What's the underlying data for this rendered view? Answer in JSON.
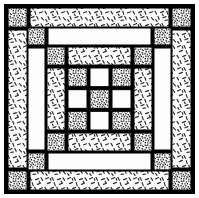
{
  "diagram": {
    "type": "quilt-block-diagram",
    "symmetry": "4-fold rotational",
    "canvas": {
      "width": 199,
      "height": 198
    },
    "background_color": "#ffffff",
    "line_color": "#000000",
    "outer_margin": 4,
    "sashing_width": 3
  },
  "fabrics": [
    {
      "key": "dark",
      "name": "dark-stipple-fabric",
      "description": "dense dark random stipple print",
      "base_color": "#f2f2f2",
      "mark_color": "#1a1a1a",
      "density": "dense"
    },
    {
      "key": "light",
      "name": "light-dash-fabric",
      "description": "sparse short dashes at varied angles",
      "base_color": "#fbfbfb",
      "mark_color": "#2b2b2b",
      "density": "sparse"
    },
    {
      "key": "plain",
      "name": "plain-white-fabric",
      "description": "solid unprinted white",
      "base_color": "#fdfdfd",
      "mark_color": "#fdfdfd",
      "density": "none"
    }
  ],
  "frame": {
    "name": "outer-frame-border",
    "x": 4,
    "y": 4,
    "width": 191,
    "height": 190
  },
  "rings": [
    {
      "name": "ring-outer",
      "index": 1,
      "corner_fabric": "dark",
      "band_fabric": "light",
      "bounds": {
        "x": 5,
        "y": 5,
        "width": 189,
        "height": 188
      },
      "corner_size": 19
    },
    {
      "name": "ring-middle",
      "index": 2,
      "corner_fabric": "dark",
      "band_fabric": "plain",
      "bounds": {
        "x": 25,
        "y": 25,
        "width": 149,
        "height": 148
      },
      "corner_size": 17
    },
    {
      "name": "ring-inner",
      "index": 3,
      "corner_fabric": "dark",
      "band_fabric": "light",
      "bounds": {
        "x": 44,
        "y": 44,
        "width": 111,
        "height": 110
      },
      "corner_size": 18
    }
  ],
  "center": {
    "name": "center-nine-patch",
    "bounds": {
      "x": 65,
      "y": 65,
      "width": 69,
      "height": 68
    },
    "grid": {
      "rows": 3,
      "cols": 3
    },
    "cells": [
      {
        "row": 0,
        "col": 0,
        "fabric": "dark",
        "name": "nine-patch-cell-top-left"
      },
      {
        "row": 0,
        "col": 1,
        "fabric": "plain",
        "name": "nine-patch-cell-top-center"
      },
      {
        "row": 0,
        "col": 2,
        "fabric": "dark",
        "name": "nine-patch-cell-top-right"
      },
      {
        "row": 1,
        "col": 0,
        "fabric": "plain",
        "name": "nine-patch-cell-middle-left"
      },
      {
        "row": 1,
        "col": 1,
        "fabric": "dark",
        "name": "nine-patch-cell-center"
      },
      {
        "row": 1,
        "col": 2,
        "fabric": "plain",
        "name": "nine-patch-cell-middle-right"
      },
      {
        "row": 2,
        "col": 0,
        "fabric": "dark",
        "name": "nine-patch-cell-bottom-left"
      },
      {
        "row": 2,
        "col": 1,
        "fabric": "plain",
        "name": "nine-patch-cell-bottom-center"
      },
      {
        "row": 2,
        "col": 2,
        "fabric": "dark",
        "name": "nine-patch-cell-bottom-right"
      }
    ]
  }
}
